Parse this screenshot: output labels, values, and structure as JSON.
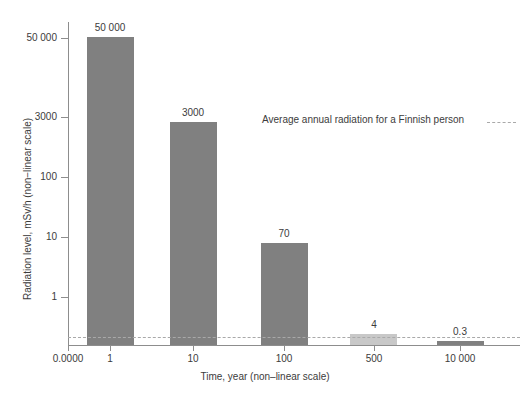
{
  "chart_data": {
    "type": "bar",
    "title": "",
    "subtitle": "",
    "xlabel": "Time, year (non–linear scale)",
    "ylabel": "Radiation level, mSv/h (non−linear scale)",
    "categories": [
      "1",
      "10",
      "100",
      "500",
      "10 000"
    ],
    "values": [
      50000,
      3000,
      70,
      4,
      0.3
    ],
    "value_labels": [
      "50 000",
      "3000",
      "70",
      "4",
      "0.3"
    ],
    "series": [
      {
        "name": "Radiation level",
        "values": [
          50000,
          3000,
          70,
          4,
          0.3
        ]
      }
    ],
    "bar_colors": [
      "#808080",
      "#808080",
      "#808080",
      "#c8c8c8",
      "#808080"
    ],
    "x_tick_labels": [
      "0.0000",
      "1",
      "10",
      "100",
      "500",
      "10 000"
    ],
    "y_tick_labels": [
      "1",
      "10",
      "100",
      "3000",
      "50 000"
    ],
    "y_tick_values": [
      1,
      10,
      100,
      3000,
      50000
    ],
    "grid": false,
    "legend": false,
    "legend_position": "none",
    "annotations": [
      {
        "text": "Average annual radiation for a Finnish person",
        "kind": "reference-line-label",
        "value": 0.33
      }
    ],
    "reference_line": {
      "label": "Average annual radiation for a Finnish person",
      "style": "dashed",
      "color": "#a9a9a9"
    },
    "axis_color": "#8d8d8d",
    "text_color": "#3c3c3c",
    "background": "#ffffff"
  },
  "axes": {
    "x_title": "Time, year (non–linear scale)",
    "y_title": "Radiation level, mSv/h (non−linear scale)"
  },
  "yticks": [
    {
      "label": "50 000",
      "top": 38
    },
    {
      "label": "3000",
      "top": 117
    },
    {
      "label": "100",
      "top": 177
    },
    {
      "label": "10",
      "top": 237
    },
    {
      "label": "1",
      "top": 297
    }
  ],
  "xticks": [
    {
      "label": "0.0000",
      "left": 68
    },
    {
      "label": "1",
      "left": 110
    },
    {
      "label": "10",
      "left": 193
    },
    {
      "label": "100",
      "left": 284
    },
    {
      "label": "500",
      "left": 374
    },
    {
      "label": "10 000",
      "left": 460
    }
  ],
  "bars": [
    {
      "label": "50 000",
      "left": 87,
      "width": 47,
      "top": 37,
      "height": 308,
      "color": "#808080",
      "label_left": 110,
      "label_top": 22
    },
    {
      "label": "3000",
      "left": 170,
      "width": 47,
      "top": 122,
      "height": 223,
      "color": "#808080",
      "label_left": 193,
      "label_top": 107
    },
    {
      "label": "70",
      "left": 261,
      "width": 47,
      "top": 243,
      "height": 102,
      "color": "#808080",
      "label_left": 284,
      "label_top": 228
    },
    {
      "label": "4",
      "left": 350,
      "width": 47,
      "top": 334,
      "height": 11,
      "color": "#c8c8c8",
      "label_left": 374,
      "label_top": 319
    },
    {
      "label": "0.3",
      "left": 437,
      "width": 47,
      "top": 341,
      "height": 4,
      "color": "#808080",
      "label_left": 460,
      "label_top": 326
    }
  ],
  "reference": {
    "annotation_text": "Average annual radiation for a Finnish person",
    "annotation_left": 262,
    "annotation_top": 114,
    "dash_left": 487,
    "dash_top": 122,
    "dash_width": 29
  }
}
